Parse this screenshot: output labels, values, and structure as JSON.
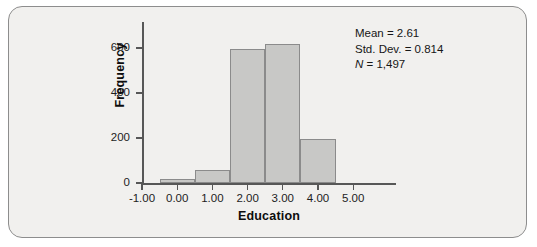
{
  "chart_data": {
    "type": "bar",
    "title": "",
    "subtitle": "",
    "xlabel": "Education",
    "ylabel": "Frequency",
    "categories": [
      "0.00",
      "1.00",
      "2.00",
      "3.00",
      "4.00"
    ],
    "bin_centers": [
      0.0,
      1.0,
      2.0,
      3.0,
      4.0
    ],
    "bin_width": 1.0,
    "values": [
      20,
      60,
      595,
      617,
      197
    ],
    "xlim": [
      -1.5,
      5.5
    ],
    "ylim": [
      0,
      700
    ],
    "x_ticks": [
      -1.0,
      0.0,
      1.0,
      2.0,
      3.0,
      4.0,
      5.0
    ],
    "x_tick_labels": [
      "-1.00",
      "0.00",
      "1.00",
      "2.00",
      "3.00",
      "4.00",
      "5.00"
    ],
    "y_ticks": [
      0,
      200,
      400,
      600
    ],
    "y_tick_labels": [
      "0",
      "200",
      "400",
      "600"
    ],
    "grid": false,
    "legend": null,
    "bar_fill_color": "#c8c8c6",
    "bar_edge_color": "#8b8b8b",
    "plot_background_color": "#f1f0ee",
    "axis_color": "#575757",
    "annotations": {
      "mean_label": "Mean = 2.61",
      "std_dev_label": "Std. Dev. = 0.814",
      "n_symbol": "N",
      "n_value": " = 1,497",
      "position": "top-right"
    }
  },
  "figure": {
    "border_color": "#8d8d8d",
    "background_color": "#f1f0ee"
  }
}
